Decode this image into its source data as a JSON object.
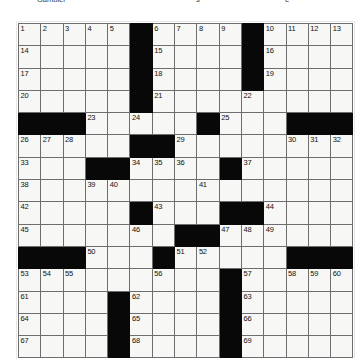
{
  "page": {
    "type": "crossword-puzzle-grid",
    "top_text_fragments": [
      "Gambler",
      "s",
      "e"
    ]
  },
  "grid": {
    "rows": 15,
    "cols": 15,
    "cell_colors": {
      "white": "#f7f7f5",
      "black": "#080808",
      "border": "#6e6e6e",
      "number": "#111111"
    },
    "layout": [
      [
        {
          "n": "1",
          "b": false
        },
        {
          "n": "2",
          "b": false
        },
        {
          "n": "3",
          "b": false
        },
        {
          "n": "4",
          "b": false
        },
        {
          "n": "5",
          "b": false
        },
        {
          "n": "",
          "b": true
        },
        {
          "n": "6",
          "b": false
        },
        {
          "n": "7",
          "b": false
        },
        {
          "n": "8",
          "b": false
        },
        {
          "n": "9",
          "b": false
        },
        {
          "n": "",
          "b": true
        },
        {
          "n": "10",
          "b": false
        },
        {
          "n": "11",
          "b": false
        },
        {
          "n": "12",
          "b": false
        },
        {
          "n": "13",
          "b": false
        }
      ],
      [
        {
          "n": "14",
          "b": false
        },
        {
          "n": "",
          "b": false
        },
        {
          "n": "",
          "b": false
        },
        {
          "n": "",
          "b": false
        },
        {
          "n": "",
          "b": false
        },
        {
          "n": "",
          "b": true
        },
        {
          "n": "15",
          "b": false
        },
        {
          "n": "",
          "b": false
        },
        {
          "n": "",
          "b": false
        },
        {
          "n": "",
          "b": false
        },
        {
          "n": "",
          "b": true
        },
        {
          "n": "16",
          "b": false
        },
        {
          "n": "",
          "b": false
        },
        {
          "n": "",
          "b": false
        },
        {
          "n": "",
          "b": false
        }
      ],
      [
        {
          "n": "17",
          "b": false
        },
        {
          "n": "",
          "b": false
        },
        {
          "n": "",
          "b": false
        },
        {
          "n": "",
          "b": false
        },
        {
          "n": "",
          "b": false
        },
        {
          "n": "",
          "b": true
        },
        {
          "n": "18",
          "b": false
        },
        {
          "n": "",
          "b": false
        },
        {
          "n": "",
          "b": false
        },
        {
          "n": "",
          "b": false
        },
        {
          "n": "",
          "b": true
        },
        {
          "n": "19",
          "b": false
        },
        {
          "n": "",
          "b": false
        },
        {
          "n": "",
          "b": false
        },
        {
          "n": "",
          "b": false
        }
      ],
      [
        {
          "n": "20",
          "b": false
        },
        {
          "n": "",
          "b": false
        },
        {
          "n": "",
          "b": false
        },
        {
          "n": "",
          "b": false
        },
        {
          "n": "",
          "b": false
        },
        {
          "n": "",
          "b": true
        },
        {
          "n": "21",
          "b": false
        },
        {
          "n": "",
          "b": false
        },
        {
          "n": "",
          "b": false
        },
        {
          "n": "",
          "b": false
        },
        {
          "n": "22",
          "b": false
        },
        {
          "n": "",
          "b": false
        },
        {
          "n": "",
          "b": false
        },
        {
          "n": "",
          "b": false
        },
        {
          "n": "",
          "b": false
        }
      ],
      [
        {
          "n": "",
          "b": true
        },
        {
          "n": "",
          "b": true
        },
        {
          "n": "",
          "b": true
        },
        {
          "n": "23",
          "b": false
        },
        {
          "n": "",
          "b": false
        },
        {
          "n": "24",
          "b": false
        },
        {
          "n": "",
          "b": false
        },
        {
          "n": "",
          "b": false
        },
        {
          "n": "",
          "b": true
        },
        {
          "n": "25",
          "b": false
        },
        {
          "n": "",
          "b": false
        },
        {
          "n": "",
          "b": false
        },
        {
          "n": "",
          "b": true
        },
        {
          "n": "",
          "b": true
        },
        {
          "n": "",
          "b": true
        }
      ],
      [
        {
          "n": "26",
          "b": false
        },
        {
          "n": "27",
          "b": false
        },
        {
          "n": "28",
          "b": false
        },
        {
          "n": "",
          "b": false
        },
        {
          "n": "",
          "b": false
        },
        {
          "n": "",
          "b": true
        },
        {
          "n": "",
          "b": true
        },
        {
          "n": "29",
          "b": false
        },
        {
          "n": "",
          "b": false
        },
        {
          "n": "",
          "b": false
        },
        {
          "n": "",
          "b": false
        },
        {
          "n": "",
          "b": false
        },
        {
          "n": "30",
          "b": false
        },
        {
          "n": "31",
          "b": false
        },
        {
          "n": "32",
          "b": false
        }
      ],
      [
        {
          "n": "33",
          "b": false
        },
        {
          "n": "",
          "b": false
        },
        {
          "n": "",
          "b": false
        },
        {
          "n": "",
          "b": true
        },
        {
          "n": "",
          "b": true
        },
        {
          "n": "34",
          "b": false
        },
        {
          "n": "35",
          "b": false
        },
        {
          "n": "36",
          "b": false
        },
        {
          "n": "",
          "b": false
        },
        {
          "n": "",
          "b": true
        },
        {
          "n": "37",
          "b": false
        },
        {
          "n": "",
          "b": false
        },
        {
          "n": "",
          "b": false
        },
        {
          "n": "",
          "b": false
        },
        {
          "n": "",
          "b": false
        }
      ],
      [
        {
          "n": "38",
          "b": false
        },
        {
          "n": "",
          "b": false
        },
        {
          "n": "",
          "b": false
        },
        {
          "n": "39",
          "b": false
        },
        {
          "n": "40",
          "b": false
        },
        {
          "n": "",
          "b": false
        },
        {
          "n": "",
          "b": false
        },
        {
          "n": "",
          "b": false
        },
        {
          "n": "41",
          "b": false
        },
        {
          "n": "",
          "b": false
        },
        {
          "n": "",
          "b": false
        },
        {
          "n": "",
          "b": false
        },
        {
          "n": "",
          "b": false
        },
        {
          "n": "",
          "b": false
        },
        {
          "n": "",
          "b": false
        }
      ],
      [
        {
          "n": "42",
          "b": false
        },
        {
          "n": "",
          "b": false
        },
        {
          "n": "",
          "b": false
        },
        {
          "n": "",
          "b": false
        },
        {
          "n": "",
          "b": false
        },
        {
          "n": "",
          "b": true
        },
        {
          "n": "43",
          "b": false
        },
        {
          "n": "",
          "b": false
        },
        {
          "n": "",
          "b": false
        },
        {
          "n": "",
          "b": true
        },
        {
          "n": "",
          "b": true
        },
        {
          "n": "44",
          "b": false
        },
        {
          "n": "",
          "b": false
        },
        {
          "n": "",
          "b": false
        },
        {
          "n": "",
          "b": false
        }
      ],
      [
        {
          "n": "45",
          "b": false
        },
        {
          "n": "",
          "b": false
        },
        {
          "n": "",
          "b": false
        },
        {
          "n": "",
          "b": false
        },
        {
          "n": "",
          "b": false
        },
        {
          "n": "46",
          "b": false
        },
        {
          "n": "",
          "b": false
        },
        {
          "n": "",
          "b": true
        },
        {
          "n": "",
          "b": true
        },
        {
          "n": "47",
          "b": false
        },
        {
          "n": "48",
          "b": false
        },
        {
          "n": "49",
          "b": false
        },
        {
          "n": "",
          "b": false
        },
        {
          "n": "",
          "b": false
        },
        {
          "n": "",
          "b": false
        }
      ],
      [
        {
          "n": "",
          "b": true
        },
        {
          "n": "",
          "b": true
        },
        {
          "n": "",
          "b": true
        },
        {
          "n": "50",
          "b": false
        },
        {
          "n": "",
          "b": false
        },
        {
          "n": "",
          "b": false
        },
        {
          "n": "",
          "b": true
        },
        {
          "n": "51",
          "b": false
        },
        {
          "n": "52",
          "b": false
        },
        {
          "n": "",
          "b": false
        },
        {
          "n": "",
          "b": false
        },
        {
          "n": "",
          "b": false
        },
        {
          "n": "",
          "b": true
        },
        {
          "n": "",
          "b": true
        },
        {
          "n": "",
          "b": true
        }
      ],
      [
        {
          "n": "53",
          "b": false
        },
        {
          "n": "54",
          "b": false
        },
        {
          "n": "55",
          "b": false
        },
        {
          "n": "",
          "b": false
        },
        {
          "n": "",
          "b": false
        },
        {
          "n": "",
          "b": false
        },
        {
          "n": "56",
          "b": false
        },
        {
          "n": "",
          "b": false
        },
        {
          "n": "",
          "b": false
        },
        {
          "n": "",
          "b": true
        },
        {
          "n": "57",
          "b": false
        },
        {
          "n": "",
          "b": false
        },
        {
          "n": "58",
          "b": false
        },
        {
          "n": "59",
          "b": false
        },
        {
          "n": "60",
          "b": false
        }
      ],
      [
        {
          "n": "61",
          "b": false
        },
        {
          "n": "",
          "b": false
        },
        {
          "n": "",
          "b": false
        },
        {
          "n": "",
          "b": false
        },
        {
          "n": "",
          "b": true
        },
        {
          "n": "62",
          "b": false
        },
        {
          "n": "",
          "b": false
        },
        {
          "n": "",
          "b": false
        },
        {
          "n": "",
          "b": false
        },
        {
          "n": "",
          "b": true
        },
        {
          "n": "63",
          "b": false
        },
        {
          "n": "",
          "b": false
        },
        {
          "n": "",
          "b": false
        },
        {
          "n": "",
          "b": false
        },
        {
          "n": "",
          "b": false
        }
      ],
      [
        {
          "n": "64",
          "b": false
        },
        {
          "n": "",
          "b": false
        },
        {
          "n": "",
          "b": false
        },
        {
          "n": "",
          "b": false
        },
        {
          "n": "",
          "b": true
        },
        {
          "n": "65",
          "b": false
        },
        {
          "n": "",
          "b": false
        },
        {
          "n": "",
          "b": false
        },
        {
          "n": "",
          "b": false
        },
        {
          "n": "",
          "b": true
        },
        {
          "n": "66",
          "b": false
        },
        {
          "n": "",
          "b": false
        },
        {
          "n": "",
          "b": false
        },
        {
          "n": "",
          "b": false
        },
        {
          "n": "",
          "b": false
        }
      ],
      [
        {
          "n": "67",
          "b": false
        },
        {
          "n": "",
          "b": false
        },
        {
          "n": "",
          "b": false
        },
        {
          "n": "",
          "b": false
        },
        {
          "n": "",
          "b": true
        },
        {
          "n": "68",
          "b": false
        },
        {
          "n": "",
          "b": false
        },
        {
          "n": "",
          "b": false
        },
        {
          "n": "",
          "b": false
        },
        {
          "n": "",
          "b": true
        },
        {
          "n": "69",
          "b": false
        },
        {
          "n": "",
          "b": false
        },
        {
          "n": "",
          "b": false
        },
        {
          "n": "",
          "b": false
        },
        {
          "n": "",
          "b": false
        }
      ]
    ]
  }
}
